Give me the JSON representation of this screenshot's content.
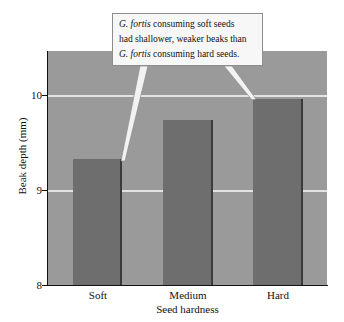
{
  "chart_data": {
    "type": "bar",
    "title": "",
    "xlabel": "Seed hardness",
    "ylabel": "Beak depth (mm)",
    "categories": [
      "Soft",
      "Medium",
      "Hard"
    ],
    "values": [
      9.32,
      9.74,
      9.96
    ],
    "ylim": [
      8,
      10.46
    ],
    "yticks": [
      "8",
      "9",
      "10"
    ],
    "ytick_values": [
      8,
      9,
      10
    ],
    "grid": "horizontal gridlines at y = 9 and y = 10",
    "legend": "none",
    "series": [
      {
        "name": "Beak depth",
        "values": [
          9.32,
          9.74,
          9.96
        ]
      }
    ],
    "annotations": [
      {
        "text": "G. fortis consuming soft seeds had shallower, weaker beaks than G. fortis consuming hard seeds.",
        "points_to": [
          "Soft",
          "Hard"
        ]
      }
    ]
  },
  "axes": {
    "y_title": "Beak depth (mm)",
    "x_title": "Seed hardness",
    "y_ticks": [
      {
        "label": "10"
      },
      {
        "label": "9"
      },
      {
        "label": "8"
      }
    ],
    "x_ticks": [
      {
        "label": "Soft"
      },
      {
        "label": "Medium"
      },
      {
        "label": "Hard"
      }
    ]
  },
  "callout": {
    "lines": [
      {
        "italic": "G. fortis",
        "rest": " consuming soft seeds"
      },
      {
        "italic": "",
        "rest": "had shallower, weaker beaks than"
      },
      {
        "italic": "G. fortis",
        "rest": " consuming hard seeds."
      }
    ],
    "line1_italic": "G. fortis",
    "line1_rest": " consuming soft seeds",
    "line2_rest": "had shallower, weaker beaks than",
    "line3_italic": "G. fortis",
    "line3_rest": " consuming hard seeds."
  },
  "colors": {
    "bar_fill": "#6e6e6e",
    "bar_edge": "#3a3a3a",
    "plot_background": "#9a9a9a",
    "gridline": "#e3e3e3",
    "callout_background": "#f7f7f7",
    "callout_border": "#8d8d8d",
    "axis": "#111111",
    "page_background": "#ffffff"
  }
}
